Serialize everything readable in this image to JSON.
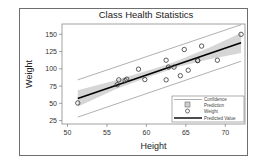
{
  "chart_data": {
    "type": "scatter",
    "title": "Class Health Statistics",
    "xlabel": "Height",
    "ylabel": "Weight",
    "xlim": [
      49.3,
      72.5
    ],
    "ylim": [
      20,
      165
    ],
    "xticks": [
      50,
      55,
      60,
      65,
      70
    ],
    "yticks": [
      25,
      50,
      75,
      100,
      125,
      150
    ],
    "grid": false,
    "legend_position": "lower right (inside)",
    "legend": [
      "Confidence",
      "Prediction",
      "Weight",
      "Predicted Value"
    ],
    "series": [
      {
        "name": "Weight",
        "kind": "scatter",
        "marker": "open-circle",
        "points": [
          {
            "x": 69.0,
            "y": 112.5
          },
          {
            "x": 56.5,
            "y": 84.0
          },
          {
            "x": 65.3,
            "y": 98.0
          },
          {
            "x": 62.8,
            "y": 102.5
          },
          {
            "x": 63.5,
            "y": 102.5
          },
          {
            "x": 57.3,
            "y": 83.0
          },
          {
            "x": 59.8,
            "y": 84.5
          },
          {
            "x": 62.5,
            "y": 112.5
          },
          {
            "x": 62.5,
            "y": 84.0
          },
          {
            "x": 59.0,
            "y": 99.5
          },
          {
            "x": 51.3,
            "y": 50.5
          },
          {
            "x": 64.3,
            "y": 90.0
          },
          {
            "x": 56.3,
            "y": 77.0
          },
          {
            "x": 66.5,
            "y": 112.0
          },
          {
            "x": 72.0,
            "y": 150.0
          },
          {
            "x": 64.8,
            "y": 128.0
          },
          {
            "x": 67.0,
            "y": 133.0
          },
          {
            "x": 57.5,
            "y": 85.0
          },
          {
            "x": 66.5,
            "y": 112.0
          }
        ]
      },
      {
        "name": "Predicted Value",
        "kind": "line",
        "intercept": -143.03,
        "slope": 3.9,
        "x": [
          51.3,
          72.0
        ],
        "y": [
          57.0,
          137.8
        ]
      },
      {
        "name": "Confidence",
        "kind": "band",
        "x": [
          51.3,
          56.0,
          60.0,
          62.3,
          64.0,
          68.0,
          72.0
        ],
        "lower": [
          45.0,
          70.0,
          87.0,
          96.0,
          103.0,
          114.0,
          123.0
        ],
        "upper": [
          69.0,
          83.0,
          97.0,
          105.0,
          112.0,
          131.0,
          152.0
        ]
      },
      {
        "name": "Prediction",
        "kind": "limits",
        "x": [
          51.3,
          72.0
        ],
        "lower": [
          30.0,
          111.0
        ],
        "upper": [
          84.0,
          164.0
        ]
      }
    ]
  },
  "legend_items": [
    {
      "label": "Confidence"
    },
    {
      "label": "Prediction"
    },
    {
      "label": "Weight"
    },
    {
      "label": "Predicted Value"
    }
  ],
  "colors": {
    "band": "#cfcfcf",
    "line": "#000000",
    "limits": "#7a7a7a",
    "marker": "#333333",
    "frame": "#6e6e6e"
  }
}
